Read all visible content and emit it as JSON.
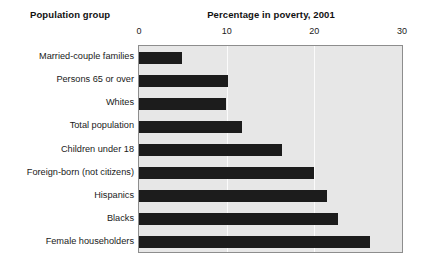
{
  "headers": {
    "group_header": "Population group",
    "chart_title": "Percentage in poverty, 2001"
  },
  "chart_data": {
    "type": "bar",
    "orientation": "horizontal",
    "title": "Percentage in poverty, 2001",
    "xlabel": "",
    "ylabel": "Population group",
    "xlim": [
      0,
      30
    ],
    "xticks": [
      0,
      10,
      20,
      30
    ],
    "xtick_labels": [
      "0",
      "10",
      "20",
      "30"
    ],
    "grid": true,
    "grid_axis": "x",
    "legend": false,
    "categories": [
      "Married-couple families",
      "Persons 65 or over",
      "Whites",
      "Total population",
      "Children under 18",
      "Foreign-born (not citizens)",
      "Hispanics",
      "Blacks",
      "Female householders"
    ],
    "values": [
      4.9,
      10.1,
      9.9,
      11.7,
      16.3,
      20.0,
      21.4,
      22.7,
      26.4
    ],
    "colors": {
      "bar": "#1c1c1c",
      "plot_background": "#e7e7e7",
      "gridline": "#fbfbfb",
      "plot_border": "#8d8d8d",
      "text": "#1a1a1a",
      "page_background": "#ffffff"
    }
  }
}
